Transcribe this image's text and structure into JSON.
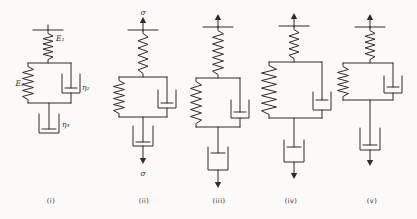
{
  "diagram": {
    "ink_color": "#2e2b28",
    "paper_color": "#fbfaf8",
    "labels": {
      "sigma_top": "σ",
      "sigma_bottom": "σ",
      "spring_series": "E₁",
      "spring_parallel": "E₂",
      "dashpot_parallel": "η₂",
      "dashpot_series": "η₃"
    },
    "captions": [
      "(i)",
      "(ii)",
      "(iii)",
      "(iv)",
      "(v)"
    ]
  }
}
